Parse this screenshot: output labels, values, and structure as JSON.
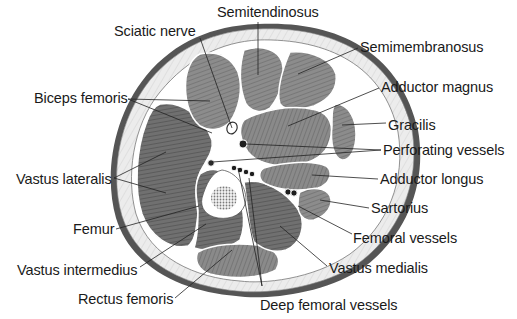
{
  "diagram": {
    "colors": {
      "background": "#ffffff",
      "skin": "#5a5a5a",
      "fat": "#e6e6e6",
      "muscle_light": "#8e8e8e",
      "muscle_dark": "#6e6e6e",
      "fascia": "#ffffff",
      "bone_cortex": "#ffffff",
      "bone_marrow": "#9a9a9a",
      "vessel": "#1e1e1e",
      "text": "#1a1a1a",
      "leader": "#222222"
    },
    "labels": [
      {
        "id": "semitendinosus",
        "text": "Semitendinosus",
        "x": 217,
        "y": 5,
        "lines": [
          [
            258,
            22,
            258,
            75
          ]
        ]
      },
      {
        "id": "sciatic-nerve",
        "text": "Sciatic nerve",
        "x": 114,
        "y": 24,
        "lines": [
          [
            200,
            38,
            232,
            128
          ]
        ]
      },
      {
        "id": "semimembranosus",
        "text": "Semimembranosus",
        "x": 360,
        "y": 40,
        "lines": [
          [
            358,
            48,
            298,
            74
          ]
        ]
      },
      {
        "id": "biceps-femoris",
        "text": "Biceps femoris",
        "x": 34,
        "y": 91,
        "lines": [
          [
            128,
            99,
            210,
            101
          ],
          [
            128,
            99,
            212,
            133
          ]
        ]
      },
      {
        "id": "adductor-magnus",
        "text": "Adductor magnus",
        "x": 381,
        "y": 80,
        "lines": [
          [
            379,
            88,
            288,
            126
          ]
        ]
      },
      {
        "id": "gracilis",
        "text": "Gracilis",
        "x": 388,
        "y": 118,
        "lines": [
          [
            386,
            123,
            342,
            125
          ]
        ]
      },
      {
        "id": "perforating-vessels",
        "text": "Perforating vessels",
        "x": 383,
        "y": 143,
        "lines": [
          [
            381,
            150,
            246,
            144
          ],
          [
            381,
            150,
            212,
            162
          ]
        ]
      },
      {
        "id": "vastus-lateralis",
        "text": "Vastus lateralis",
        "x": 16,
        "y": 172,
        "lines": [
          [
            114,
            178,
            166,
            152
          ],
          [
            114,
            178,
            166,
            193
          ]
        ]
      },
      {
        "id": "adductor-longus",
        "text": "Adductor longus",
        "x": 380,
        "y": 172,
        "lines": [
          [
            378,
            179,
            312,
            175
          ]
        ]
      },
      {
        "id": "sartorius",
        "text": "Sartorius",
        "x": 371,
        "y": 201,
        "lines": [
          [
            369,
            208,
            320,
            200
          ]
        ]
      },
      {
        "id": "femur",
        "text": "Femur",
        "x": 73,
        "y": 222,
        "lines": [
          [
            116,
            229,
            199,
            206
          ]
        ]
      },
      {
        "id": "femoral-vessels",
        "text": "Femoral vessels",
        "x": 353,
        "y": 231,
        "lines": [
          [
            352,
            234,
            298,
            206
          ]
        ]
      },
      {
        "id": "vastus-intermedius",
        "text": "Vastus intermedius",
        "x": 17,
        "y": 263,
        "lines": [
          [
            140,
            267,
            206,
            224
          ]
        ]
      },
      {
        "id": "vastus-medialis",
        "text": "Vastus medialis",
        "x": 329,
        "y": 261,
        "lines": [
          [
            327,
            266,
            280,
            226
          ]
        ]
      },
      {
        "id": "rectus-femoris",
        "text": "Rectus femoris",
        "x": 78,
        "y": 292,
        "lines": [
          [
            175,
            298,
            232,
            250
          ]
        ]
      },
      {
        "id": "deep-femoral-vessels",
        "text": "Deep femoral vessels",
        "x": 260,
        "y": 298,
        "lines": [
          [
            262,
            286,
            249,
            178
          ],
          [
            262,
            286,
            238,
            168
          ]
        ]
      }
    ]
  }
}
